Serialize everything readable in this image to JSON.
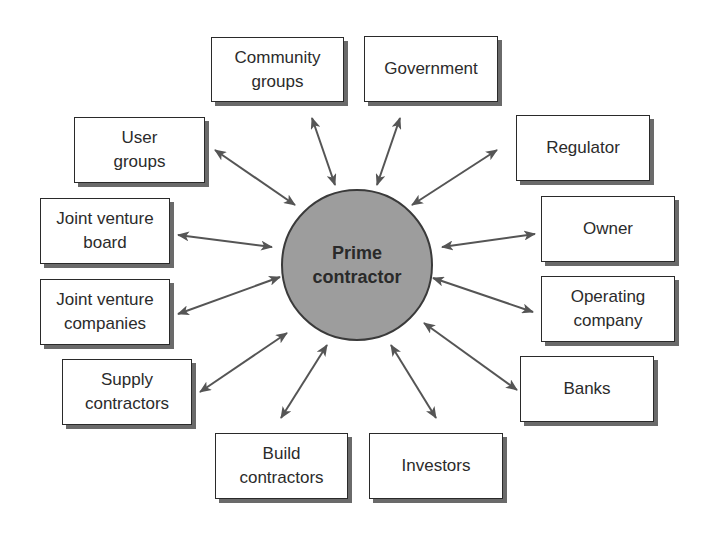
{
  "diagram": {
    "hub": {
      "line1": "Prime",
      "line2": "contractor"
    },
    "nodes": {
      "community_groups": {
        "line1": "Community",
        "line2": "groups"
      },
      "government": {
        "line1": "Government"
      },
      "user_groups": {
        "line1": "User",
        "line2": "groups"
      },
      "regulator": {
        "line1": "Regulator"
      },
      "jv_board": {
        "line1": "Joint venture",
        "line2": "board"
      },
      "owner": {
        "line1": "Owner"
      },
      "jv_companies": {
        "line1": "Joint venture",
        "line2": "companies"
      },
      "operating_company": {
        "line1": "Operating",
        "line2": "company"
      },
      "supply_contractors": {
        "line1": "Supply",
        "line2": "contractors"
      },
      "banks": {
        "line1": "Banks"
      },
      "build_contractors": {
        "line1": "Build",
        "line2": "contractors"
      },
      "investors": {
        "line1": "Investors"
      }
    },
    "colors": {
      "hub_fill": "#9d9d9d",
      "arrow": "#555555",
      "border": "#2a2a2a",
      "shadow": "#6a6a6a"
    }
  }
}
